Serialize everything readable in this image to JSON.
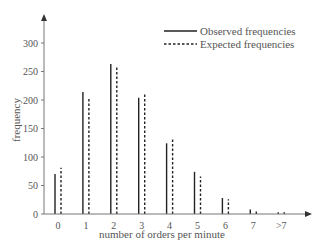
{
  "chart_data": {
    "type": "bar",
    "title": "",
    "xlabel": "number of orders per minute",
    "ylabel": "frequency",
    "categories": [
      "0",
      "1",
      "2",
      "3",
      "4",
      "5",
      "6",
      "7",
      ">7"
    ],
    "series": [
      {
        "name": "Observed frequencies",
        "style": "solid",
        "values": [
          70,
          214,
          263,
          204,
          124,
          74,
          28,
          8,
          3
        ]
      },
      {
        "name": "Expected frequencies",
        "style": "dashed",
        "values": [
          81,
          205,
          258,
          213,
          133,
          66,
          26,
          8,
          3
        ]
      }
    ],
    "yticks": [
      0,
      50,
      100,
      150,
      200,
      250,
      300
    ],
    "ylim": [
      0,
      350
    ],
    "grid": false,
    "legend_position": "top-right"
  },
  "legend": {
    "observed": "Observed frequencies",
    "expected": "Expected frequencies"
  },
  "axes": {
    "xlabel": "number of orders per minute",
    "ylabel": "frequency"
  }
}
